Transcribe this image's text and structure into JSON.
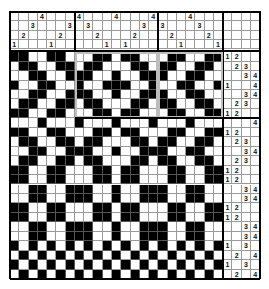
{
  "draft": {
    "columns": 23,
    "shafts": 4,
    "treadle_columns": 4,
    "threading": [
      1,
      2,
      3,
      4,
      1,
      2,
      3,
      4,
      3,
      2,
      1,
      4,
      1,
      2,
      3,
      4,
      3,
      2,
      1,
      4,
      3,
      2,
      1
    ],
    "treadling": [
      [
        1,
        2
      ],
      [
        2,
        3
      ],
      [
        3,
        4
      ],
      [
        1,
        4
      ],
      [
        3,
        4
      ],
      [
        2,
        3
      ],
      [
        1,
        2
      ],
      [
        4
      ],
      [
        1,
        2
      ],
      [
        2,
        3
      ],
      [
        3,
        4
      ],
      [
        2,
        3
      ],
      [
        1,
        2
      ],
      [
        1,
        2
      ],
      [
        3,
        4
      ],
      [
        3,
        4
      ],
      [
        1,
        2
      ],
      [
        1,
        2
      ],
      [
        3,
        4
      ],
      [
        3,
        4
      ],
      [
        1,
        3
      ],
      [
        2,
        4
      ],
      [
        1,
        3
      ],
      [
        2,
        4
      ]
    ],
    "block_dividers_columns": [
      7,
      16
    ],
    "block_divider_row": 7,
    "colors": {
      "filled": "#000000",
      "empty": "#ffffff",
      "grid": "#9a9a9a",
      "frame": "#bdbdbd"
    }
  }
}
